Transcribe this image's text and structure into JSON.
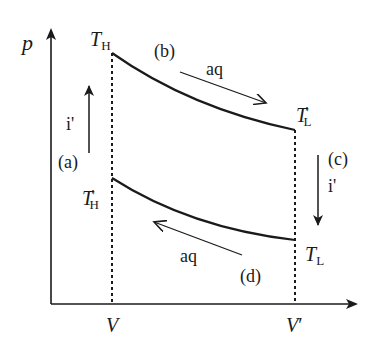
{
  "diagram": {
    "type": "p-V cycle diagram",
    "axes": {
      "y_label": "p",
      "x_ticks": [
        {
          "label_main": "V",
          "label_prime": ""
        },
        {
          "label_main": "V",
          "label_prime": "′"
        }
      ]
    },
    "corners": {
      "top_left": {
        "main": "T",
        "sub": "H",
        "prime": ""
      },
      "top_right": {
        "main": "T",
        "sub": "L",
        "prime": "′"
      },
      "bottom_left": {
        "main": "T",
        "sub": "H",
        "prime": "′"
      },
      "bottom_right": {
        "main": "T",
        "sub": "L",
        "prime": ""
      }
    },
    "processes": [
      {
        "id": "a",
        "label": "(a)",
        "kind": "i'",
        "direction": "up"
      },
      {
        "id": "b",
        "label": "(b)",
        "kind": "aq",
        "direction": "right-down"
      },
      {
        "id": "c",
        "label": "(c)",
        "kind": "i'",
        "direction": "down"
      },
      {
        "id": "d",
        "label": "(d)",
        "kind": "aq",
        "direction": "left-up"
      }
    ],
    "colors": {
      "line": "#1a1a1a",
      "background": "#ffffff"
    }
  }
}
